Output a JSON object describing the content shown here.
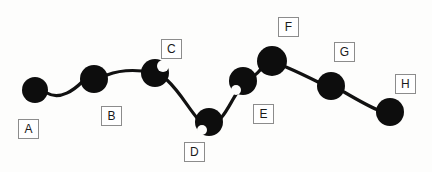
{
  "diagram": {
    "type": "node-link-chain",
    "title": "",
    "background_color": "#fdfdfc",
    "node_color": "#0d0d0d",
    "edge_color": "#111111",
    "label_border_color": "#8c8c8c",
    "label_text_color": "#1a1a1a",
    "nodes": [
      {
        "id": "A",
        "label": "A",
        "cx": 35,
        "cy": 90,
        "r": 13,
        "label_x": 18,
        "label_y": 119
      },
      {
        "id": "B",
        "label": "B",
        "cx": 94,
        "cy": 79,
        "r": 14,
        "label_x": 101,
        "label_y": 106
      },
      {
        "id": "C",
        "label": "C",
        "cx": 155,
        "cy": 73,
        "r": 14,
        "label_x": 161,
        "label_y": 39
      },
      {
        "id": "D",
        "label": "D",
        "cx": 209,
        "cy": 122,
        "r": 14,
        "label_x": 184,
        "label_y": 142
      },
      {
        "id": "E",
        "label": "E",
        "cx": 243,
        "cy": 81,
        "r": 14,
        "label_x": 253,
        "label_y": 104
      },
      {
        "id": "F",
        "label": "F",
        "cx": 272,
        "cy": 61,
        "r": 15,
        "label_x": 278,
        "label_y": 17
      },
      {
        "id": "G",
        "label": "G",
        "cx": 331,
        "cy": 86,
        "r": 14,
        "label_x": 334,
        "label_y": 42
      },
      {
        "id": "H",
        "label": "H",
        "cx": 390,
        "cy": 112,
        "r": 14,
        "label_x": 395,
        "label_y": 74
      }
    ],
    "edges": [
      {
        "from": "A",
        "to": "B",
        "path": "M 47 93 C 60 101, 75 89, 82 82"
      },
      {
        "from": "B",
        "to": "C",
        "path": "M 107 75 C 120 70, 132 70, 142 71"
      },
      {
        "from": "C",
        "to": "D",
        "path": "M 167 80 C 180 92, 189 109, 198 119"
      },
      {
        "from": "D",
        "to": "E",
        "path": "M 221 118 C 228 110, 233 98, 237 93"
      },
      {
        "from": "E",
        "to": "F",
        "path": "M 255 75 C 258 73, 259 71, 261 69"
      },
      {
        "from": "F",
        "to": "G",
        "path": "M 286 67 C 300 73, 312 79, 320 83"
      },
      {
        "from": "G",
        "to": "H",
        "path": "M 344 92 C 356 99, 368 106, 378 110"
      }
    ]
  }
}
